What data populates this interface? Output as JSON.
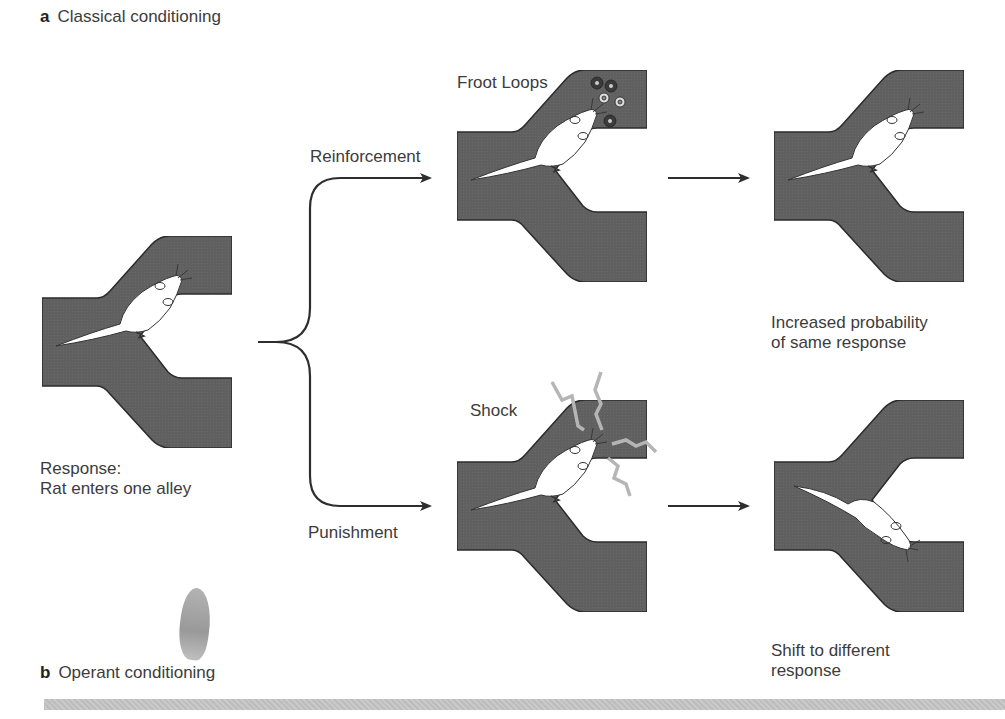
{
  "panels": {
    "a": {
      "letter": "a",
      "title": "Classical conditioning"
    },
    "b": {
      "letter": "b",
      "title": "Operant conditioning"
    }
  },
  "start": {
    "caption_line1": "Response:",
    "caption_line2": "Rat enters one alley"
  },
  "branches": {
    "top_label": "Reinforcement",
    "bottom_label": "Punishment"
  },
  "stimuli": {
    "reward_label": "Froot Loops",
    "shock_label": "Shock"
  },
  "outcomes": {
    "top_line1": "Increased probability",
    "top_line2": "of same response",
    "bottom_line1": "Shift to different",
    "bottom_line2": "response"
  },
  "colors": {
    "maze_fill": "#5f5f5f",
    "maze_outline": "#2b2b2b",
    "rat_fill": "#ffffff",
    "arrow": "#2e2e2e",
    "shock": "#b5b5b5",
    "footer_bar": "#c2c2c2"
  }
}
